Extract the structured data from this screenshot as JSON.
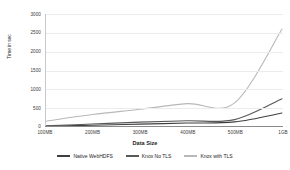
{
  "chart_data": {
    "type": "line",
    "title": "",
    "xlabel": "Data Size",
    "ylabel": "Time in sec",
    "categories": [
      "100MB",
      "200MB",
      "300MB",
      "400MB",
      "500MB",
      "1GB"
    ],
    "ylim": [
      0,
      3000
    ],
    "yticks": [
      0,
      500,
      1000,
      1500,
      2000,
      2500,
      3000
    ],
    "ytick_labels": [
      "0",
      "500",
      "1000",
      "1500",
      "2000",
      "2500",
      "3000"
    ],
    "grid": true,
    "legend_position": "bottom",
    "series": [
      {
        "name": "Native WebHDFS",
        "color": "#3f3f3f",
        "values": [
          20,
          45,
          75,
          105,
          135,
          370
        ]
      },
      {
        "name": "Knox No TLS",
        "color": "#595959",
        "values": [
          30,
          80,
          130,
          165,
          195,
          750
        ]
      },
      {
        "name": "Knox with TLS",
        "color": "#b8b8b8",
        "values": [
          150,
          330,
          470,
          620,
          640,
          2600
        ]
      }
    ]
  },
  "axis": {
    "y_title": "Time in sec",
    "x_title": "Data Size"
  }
}
